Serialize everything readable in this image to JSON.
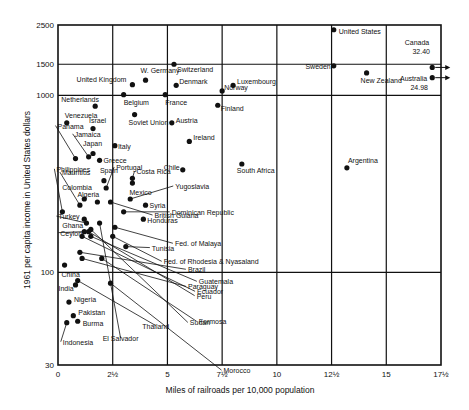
{
  "chart_data": {
    "type": "scatter",
    "title": "",
    "xlabel": "Miles of railroads per 10,000 population",
    "ylabel": "1961 per capita income in United States dollars",
    "xlim": [
      0,
      17.5
    ],
    "ylim": [
      30,
      2500
    ],
    "yscale": "log",
    "grid": true,
    "x_ticks": [
      {
        "value": 0,
        "label": "0"
      },
      {
        "value": 2.5,
        "label": "2½"
      },
      {
        "value": 5,
        "label": "5"
      },
      {
        "value": 7.5,
        "label": "7½"
      },
      {
        "value": 10,
        "label": "10"
      },
      {
        "value": 12.5,
        "label": "12½"
      },
      {
        "value": 15,
        "label": "15"
      },
      {
        "value": 17.5,
        "label": "17½"
      }
    ],
    "y_ticks": [
      {
        "value": 2500,
        "label": "2500"
      },
      {
        "value": 1500,
        "label": "1500"
      },
      {
        "value": 1000,
        "label": "1000"
      },
      {
        "value": 100,
        "label": "100"
      },
      {
        "value": 30,
        "label": "30"
      }
    ],
    "points": [
      {
        "name": "United States",
        "x": 12.6,
        "y": 2350
      },
      {
        "name": "Canada",
        "x": 17.1,
        "y": 1440,
        "off_scale_x": "32.40"
      },
      {
        "name": "Australia",
        "x": 17.1,
        "y": 1260,
        "off_scale_x": "24.98"
      },
      {
        "name": "Sweden",
        "x": 12.6,
        "y": 1470
      },
      {
        "name": "New Zealand",
        "x": 14.1,
        "y": 1340
      },
      {
        "name": "Switzerland",
        "x": 5.3,
        "y": 1500
      },
      {
        "name": "Luxembourg",
        "x": 8.0,
        "y": 1140
      },
      {
        "name": "Norway",
        "x": 7.5,
        "y": 1060
      },
      {
        "name": "United Kingdom",
        "x": 3.4,
        "y": 1150
      },
      {
        "name": "W. Germany",
        "x": 4.0,
        "y": 1220
      },
      {
        "name": "Denmark",
        "x": 5.4,
        "y": 1140
      },
      {
        "name": "Belgium",
        "x": 3.0,
        "y": 1010
      },
      {
        "name": "France",
        "x": 4.9,
        "y": 1010
      },
      {
        "name": "Finland",
        "x": 7.3,
        "y": 880
      },
      {
        "name": "Netherlands",
        "x": 1.7,
        "y": 870
      },
      {
        "name": "Venezuela",
        "x": 0.4,
        "y": 700
      },
      {
        "name": "Israel",
        "x": 1.6,
        "y": 650
      },
      {
        "name": "Soviet Union",
        "x": 3.5,
        "y": 780
      },
      {
        "name": "Austria",
        "x": 5.2,
        "y": 700
      },
      {
        "name": "Ireland",
        "x": 6.0,
        "y": 550
      },
      {
        "name": "Italy",
        "x": 2.6,
        "y": 520
      },
      {
        "name": "Panama",
        "x": 0.8,
        "y": 440
      },
      {
        "name": "Jamaica",
        "x": 1.4,
        "y": 450
      },
      {
        "name": "Japan",
        "x": 1.6,
        "y": 470
      },
      {
        "name": "Greece",
        "x": 1.9,
        "y": 430
      },
      {
        "name": "Chile",
        "x": 5.7,
        "y": 380
      },
      {
        "name": "South Africa",
        "x": 8.4,
        "y": 410
      },
      {
        "name": "Argentina",
        "x": 13.2,
        "y": 390
      },
      {
        "name": "Portugal",
        "x": 2.2,
        "y": 300
      },
      {
        "name": "Spain",
        "x": 2.1,
        "y": 330
      },
      {
        "name": "Costa Rica",
        "x": 3.4,
        "y": 340
      },
      {
        "name": "Mexico",
        "x": 3.4,
        "y": 320
      },
      {
        "name": "Yugoslavia",
        "x": 3.3,
        "y": 260
      },
      {
        "name": "Philippines",
        "x": 0.2,
        "y": 220
      },
      {
        "name": "Mauritius",
        "x": 1.0,
        "y": 240
      },
      {
        "name": "Colombia",
        "x": 1.2,
        "y": 260
      },
      {
        "name": "Algeria",
        "x": 1.8,
        "y": 250
      },
      {
        "name": "Syria",
        "x": 4.0,
        "y": 240
      },
      {
        "name": "Dominican Republic",
        "x": 3.0,
        "y": 220
      },
      {
        "name": "Honduras",
        "x": 3.9,
        "y": 200
      },
      {
        "name": "British Guiana",
        "x": 2.4,
        "y": 250
      },
      {
        "name": "Ghana",
        "x": 1.2,
        "y": 200
      },
      {
        "name": "Turkey",
        "x": 1.3,
        "y": 190
      },
      {
        "name": "Ceylon",
        "x": 1.2,
        "y": 170
      },
      {
        "name": "Fed. of Malaya",
        "x": 2.6,
        "y": 180
      },
      {
        "name": "Fed. of Rhodesia & Nyasaland",
        "x": 2.5,
        "y": 160
      },
      {
        "name": "Tunisia",
        "x": 3.1,
        "y": 140
      },
      {
        "name": "China",
        "x": 0.3,
        "y": 110
      },
      {
        "name": "Brazil",
        "x": 1.0,
        "y": 130
      },
      {
        "name": "Paraguay",
        "x": 1.1,
        "y": 120
      },
      {
        "name": "Guatemala",
        "x": 1.5,
        "y": 160
      },
      {
        "name": "Ecuador",
        "x": 1.1,
        "y": 160
      },
      {
        "name": "Peru",
        "x": 1.4,
        "y": 170
      },
      {
        "name": "Formosa",
        "x": 2.0,
        "y": 120
      },
      {
        "name": "Sudan",
        "x": 1.5,
        "y": 175
      },
      {
        "name": "El Salvador",
        "x": 1.9,
        "y": 190
      },
      {
        "name": "Morocco",
        "x": 2.4,
        "y": 87
      },
      {
        "name": "India",
        "x": 0.8,
        "y": 85
      },
      {
        "name": "Thailand",
        "x": 0.9,
        "y": 90
      },
      {
        "name": "Nigeria",
        "x": 0.5,
        "y": 68
      },
      {
        "name": "Pakistan",
        "x": 0.7,
        "y": 57
      },
      {
        "name": "Burma",
        "x": 0.9,
        "y": 53
      },
      {
        "name": "Indonesia",
        "x": 0.4,
        "y": 52
      }
    ]
  }
}
